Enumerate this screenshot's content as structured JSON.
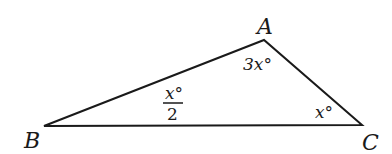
{
  "diagram": {
    "type": "triangle",
    "vertices": {
      "A": {
        "label": "A",
        "x": 264,
        "y": 40
      },
      "B": {
        "label": "B",
        "x": 44,
        "y": 126
      },
      "C": {
        "label": "C",
        "x": 362,
        "y": 125
      }
    },
    "angles": {
      "A": {
        "label": "3x°"
      },
      "B": {
        "numerator": "x°",
        "denominator": "2"
      },
      "C": {
        "label": "x°"
      }
    },
    "stroke_color": "#1a1a1a"
  }
}
